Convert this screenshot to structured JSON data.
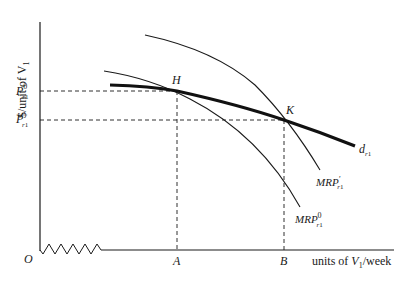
{
  "diagram": {
    "y_axis_label": "$/unit of V",
    "y_axis_label_sub": "1",
    "x_axis_label_pre": "units of ",
    "x_axis_label_var": "V",
    "x_axis_label_sub": "1",
    "x_axis_label_post": "/week",
    "origin_label": "O",
    "price_levels": [
      {
        "label": "P",
        "sup": "0",
        "sub": "r",
        "sub2": "1"
      },
      {
        "label": "P",
        "sup": "′",
        "sub": "r",
        "sub2": "1"
      }
    ],
    "quantity_marks": [
      {
        "label": "A"
      },
      {
        "label": "B"
      }
    ],
    "points": [
      {
        "label": "H"
      },
      {
        "label": "K"
      }
    ],
    "curves": [
      {
        "label": "d",
        "sub": "r",
        "sub2": "1"
      },
      {
        "label": "MRP",
        "sup": "′",
        "sub": "r",
        "sub2": "1"
      },
      {
        "label": "MRP",
        "sup": "0",
        "sub": "r",
        "sub2": "1"
      }
    ],
    "colors": {
      "ink": "#1a1a1a",
      "background": "#ffffff"
    }
  }
}
